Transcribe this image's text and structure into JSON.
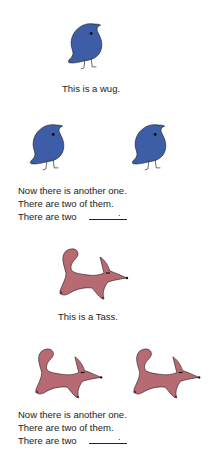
{
  "colors": {
    "wug": "#3d5ea6",
    "tass": "#b86a72",
    "outline": "#1a1a1a"
  },
  "section1": {
    "caption": "This is a wug.",
    "lines": [
      "Now there is another one.",
      "There are two of them.",
      "There are two"
    ],
    "blank_end": "."
  },
  "section2": {
    "caption": "This is a Tass.",
    "lines": [
      "Now there is another one.",
      "There are two of them.",
      "There are two"
    ],
    "blank_end": "."
  }
}
